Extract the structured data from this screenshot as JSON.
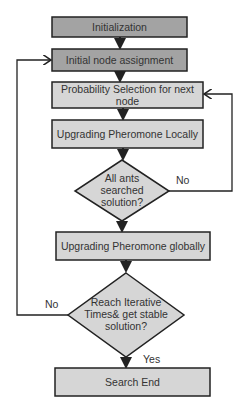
{
  "diagram": {
    "type": "flowchart",
    "colors": {
      "dark_fill": "#a3a3a3",
      "light_fill": "#d6d6d6",
      "stroke": "#222222",
      "text": "#333333"
    },
    "nodes": {
      "initialization": {
        "label": "Initialization"
      },
      "initial_node": {
        "label": "Initial node assignment"
      },
      "probability": {
        "line1": "Probability Selection for next",
        "line2": "node"
      },
      "local": {
        "label": "Upgrading Pheromone Locally"
      },
      "decision1": {
        "line1": "All ants",
        "line2": "searched",
        "line3": "solution?"
      },
      "global": {
        "label": "Upgrading Pheromone globally"
      },
      "decision2": {
        "line1": "Reach Iterative",
        "line2": "Times& get stable",
        "line3": "solution?"
      },
      "end": {
        "label": "Search End"
      }
    },
    "edges": {
      "decision1_no": "No",
      "decision2_no": "No",
      "decision2_yes": "Yes"
    }
  }
}
